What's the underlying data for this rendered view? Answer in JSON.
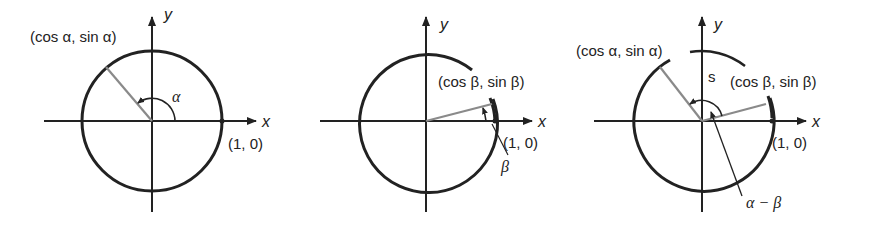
{
  "figure": {
    "panels": [
      {
        "id": "alpha",
        "x_label": "x",
        "y_label": "y",
        "point_label": "(cos α, sin α)",
        "unit_point_label": "(1, 0)",
        "angle_label": "α",
        "angle_deg": 128
      },
      {
        "id": "beta",
        "x_label": "x",
        "y_label": "y",
        "point_label": "(cos β, sin β)",
        "unit_point_label": "(1, 0)",
        "angle_label": "β",
        "angle_deg": 14
      },
      {
        "id": "difference",
        "x_label": "x",
        "y_label": "y",
        "point_a_label": "(cos α, sin α)",
        "point_b_label": "(cos β, sin β)",
        "unit_point_label": "(1, 0)",
        "arc_label": "s",
        "angle_label": "α − β"
      }
    ],
    "colors": {
      "ink": "#222222",
      "radius": "#8a8a8a",
      "background": "#ffffff"
    }
  }
}
